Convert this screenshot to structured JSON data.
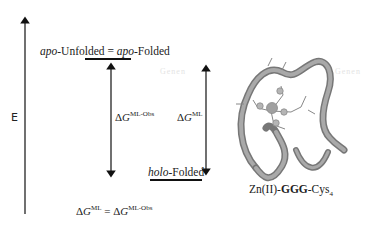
{
  "diagram": {
    "axis_label": "E",
    "top_state": {
      "part1_italic": "apo",
      "part1_rest": "-Unfolded = ",
      "part2_italic": "apo",
      "part2_rest": "-Folded"
    },
    "bottom_state": {
      "italic": "holo",
      "rest": "-Folded"
    },
    "arrow_obs": {
      "delta": "Δ",
      "symbol": "G",
      "superscript": "ML-Obs"
    },
    "arrow_ml": {
      "delta": "Δ",
      "symbol": "G",
      "superscript": "ML"
    },
    "equation": {
      "lhs_delta": "Δ",
      "lhs_symbol": "G",
      "lhs_sup": "ML",
      "equals": " = ",
      "rhs_delta": "Δ",
      "rhs_symbol": "G",
      "rhs_sup": "ML-Obs"
    },
    "molecule_caption": {
      "prefix": "Zn(II)-",
      "bold": "GGG",
      "suffix": "-Cys",
      "subscript": "4"
    },
    "watermark_text": "Genen"
  }
}
